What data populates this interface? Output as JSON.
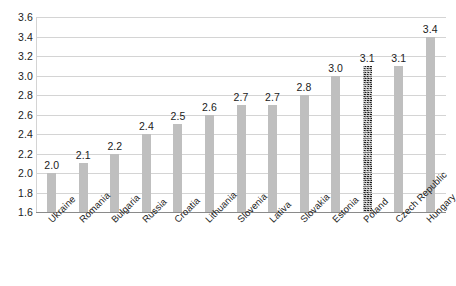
{
  "chart_data": {
    "type": "bar",
    "title": "",
    "subtitle": "",
    "xlabel": "",
    "ylabel": "",
    "ylim": [
      1.6,
      3.6
    ],
    "y_ticks": [
      "1.6",
      "1.8",
      "2.0",
      "2.2",
      "2.4",
      "2.6",
      "2.8",
      "3.0",
      "3.2",
      "3.4",
      "3.6"
    ],
    "grid": true,
    "legend": "none",
    "categories": [
      "Ukraine",
      "Romania",
      "Bulgaria",
      "Russia",
      "Croatia",
      "Lithuania",
      "Slovenia",
      "Lativa",
      "Slovakia",
      "Estonia",
      "Poland",
      "Czech Republic",
      "Hungary"
    ],
    "values": [
      2.0,
      2.1,
      2.2,
      2.4,
      2.5,
      2.6,
      2.7,
      2.7,
      2.8,
      3.0,
      3.1,
      3.1,
      3.4
    ],
    "value_labels": [
      "2.0",
      "2.1",
      "2.2",
      "2.4",
      "2.5",
      "2.6",
      "2.7",
      "2.7",
      "2.8",
      "3.0",
      "3.1",
      "3.1",
      "3.4"
    ],
    "highlighted_index": 10,
    "highlighted_category": "Poland"
  },
  "colors": {
    "bar_fill": "#bfbfbf",
    "bar_highlight_fill": "#3f3f3f",
    "gridline": "#d4d4d4",
    "axis_line": "#8a8a8a",
    "text": "#1b1b1b",
    "background": "#ffffff"
  }
}
